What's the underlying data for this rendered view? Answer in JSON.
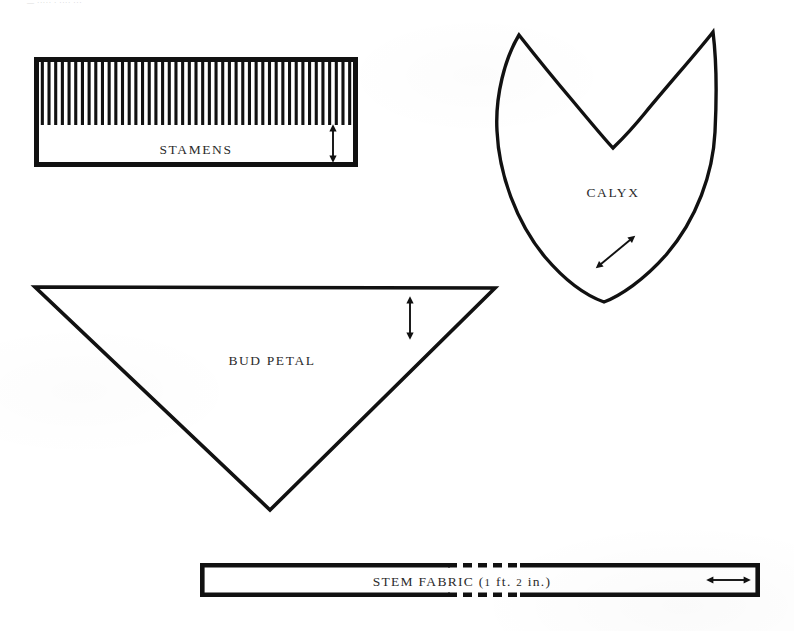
{
  "page": {
    "width": 794,
    "height": 631,
    "background_color": "#ffffff",
    "ink_color": "#111111",
    "header_text": "— ····· · ···· ···"
  },
  "pieces": [
    {
      "id": "stamens",
      "label": "STAMENS",
      "shape": "rectangle",
      "label_x": 196,
      "label_y": 150,
      "rect": {
        "x": 34,
        "y": 57,
        "width": 324,
        "height": 110
      },
      "comb": {
        "teeth": 47,
        "top": 60,
        "bottom": 125,
        "tooth_width": 3.1
      },
      "grain_arrow": {
        "type": "double-arrow-vertical",
        "x": 333,
        "y1": 128,
        "y2": 158
      }
    },
    {
      "id": "calyx",
      "label": "CALYX",
      "shape": "heart-leaf",
      "label_x": 613,
      "label_y": 193,
      "path": "M 519 35 C 505 58 495 96 497 131 C 499 174 516 222 545 257 C 568 284 590 297 604 302 C 620 296 644 280 666 255 C 697 219 713 173 715 132 C 717 92 716 56 713 32 C 700 49 668 85 645 113 C 627 135 617 144 613 148 C 607 142 592 124 572 100 C 549 73 530 49 519 35 Z",
      "grain_arrow": {
        "type": "double-arrow-diagonal",
        "x1": 600,
        "y1": 265,
        "x2": 631,
        "y2": 239
      }
    },
    {
      "id": "bud-petal",
      "label": "BUD PETAL",
      "shape": "triangle-down",
      "label_x": 272,
      "label_y": 361,
      "points": "35,287 495,288 270,510",
      "grain_arrow": {
        "type": "double-arrow-vertical",
        "x": 410,
        "y1": 300,
        "y2": 336
      }
    },
    {
      "id": "stem-fabric",
      "label": "STEM FABRIC (1 ft. 2 in.)",
      "label_prefix": "STEM FABRIC (",
      "label_measure_feet": "1",
      "label_unit_feet": " ft. ",
      "label_measure_inches": "2",
      "label_unit_inches": " in.)",
      "shape": "long-strip",
      "label_x": 462,
      "label_y": 582,
      "rect": {
        "x": 200,
        "y": 563,
        "width": 560,
        "height": 34
      },
      "break_dashes": {
        "x_start": 448,
        "x_end": 522,
        "dash_pattern": "9 6"
      },
      "grain_arrow": {
        "type": "double-arrow-horizontal",
        "y": 580,
        "x1": 711,
        "x2": 746
      }
    }
  ],
  "legend": {
    "arrow_meaning": "grain line / straight of grain",
    "dashed_meaning": "pattern continues — length break"
  }
}
